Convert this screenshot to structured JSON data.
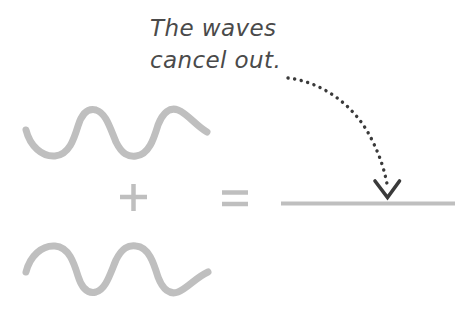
{
  "diagram": {
    "title_text": "The waves\ncancel out.",
    "colors": {
      "wave": "#bfbfbf",
      "operator": "#bfbfbf",
      "flat_line": "#bfbfbf",
      "annotation_text": "#4a4a4a",
      "arrow": "#3a3a3a",
      "background": "#ffffff"
    },
    "operators": {
      "plus_symbol": "+",
      "equals_symbol": "="
    },
    "labels": {
      "wave_top": "wave 1",
      "wave_bottom": "wave 2",
      "result": "flat line (zero amplitude)",
      "arrow": "pointer to result"
    }
  }
}
